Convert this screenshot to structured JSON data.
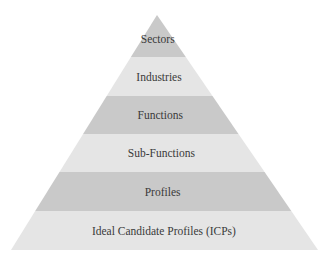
{
  "diagram": {
    "type": "pyramid",
    "apex": {
      "x": 157,
      "y": 15
    },
    "base": {
      "left_x": 11,
      "right_x": 318,
      "y": 250
    },
    "colors": {
      "dark_band": "#c9c9c9",
      "light_band": "#e5e5e5",
      "text": "#3a3a3a"
    },
    "levels": [
      {
        "label": "Sectors",
        "top": 15,
        "bottom": 57,
        "shade": "dark"
      },
      {
        "label": "Industries",
        "top": 57,
        "bottom": 96,
        "shade": "light"
      },
      {
        "label": "Functions",
        "top": 96,
        "bottom": 134,
        "shade": "dark"
      },
      {
        "label": "Sub-Functions",
        "top": 134,
        "bottom": 172,
        "shade": "light"
      },
      {
        "label": "Profiles",
        "top": 172,
        "bottom": 211,
        "shade": "dark"
      },
      {
        "label": "Ideal Candidate Profiles (ICPs)",
        "top": 211,
        "bottom": 250,
        "shade": "light"
      }
    ]
  }
}
